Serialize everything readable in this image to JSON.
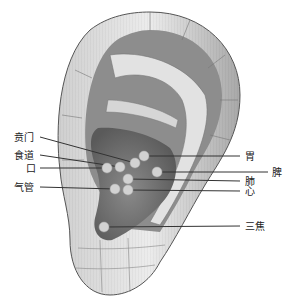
{
  "colors": {
    "ear_light": "#d9d9d9",
    "ear_mid": "#9a9a9a",
    "ear_dark": "#5e5e5e",
    "point": "#cfcfcf",
    "line": "#333333"
  },
  "points": [
    {
      "id": "bēnmén",
      "label": "贲门",
      "x": 135,
      "y": 163,
      "label_x": 14,
      "label_y": 132,
      "side": "left"
    },
    {
      "id": "shídào",
      "label": "食道",
      "x": 120,
      "y": 167,
      "label_x": 14,
      "label_y": 150,
      "side": "left"
    },
    {
      "id": "kǒu",
      "label": "口",
      "x": 107,
      "y": 168,
      "label_x": 26,
      "label_y": 163,
      "side": "left"
    },
    {
      "id": "qìguǎn",
      "label": "气管",
      "x": 115,
      "y": 189,
      "label_x": 14,
      "label_y": 182,
      "side": "left"
    },
    {
      "id": "wèi",
      "label": "胃",
      "x": 144,
      "y": 156,
      "label_x": 245,
      "label_y": 152,
      "side": "right"
    },
    {
      "id": "pí",
      "label": "脾",
      "x": 157,
      "y": 172,
      "label_x": 272,
      "label_y": 168,
      "side": "right"
    },
    {
      "id": "fèi",
      "label": "肺",
      "x": 128,
      "y": 179,
      "label_x": 245,
      "label_y": 177,
      "side": "right"
    },
    {
      "id": "xīn",
      "label": "心",
      "x": 128,
      "y": 190,
      "label_x": 245,
      "label_y": 187,
      "side": "right"
    },
    {
      "id": "sānjiāo",
      "label": "三焦",
      "x": 104,
      "y": 227,
      "label_x": 245,
      "label_y": 222,
      "side": "right"
    }
  ]
}
